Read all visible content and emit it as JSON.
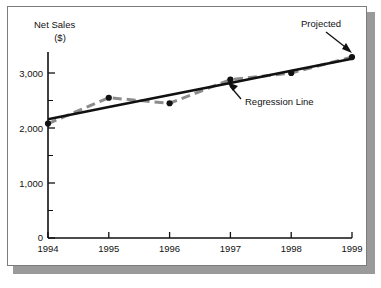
{
  "chart_data": {
    "type": "line",
    "title": "",
    "ylabel_line1": "Net Sales",
    "ylabel_line2": "($)",
    "xlabel": "",
    "categories": [
      "1994",
      "1995",
      "1996",
      "1997",
      "1998",
      "1999"
    ],
    "xlim": [
      1994,
      1999
    ],
    "ylim": [
      0,
      3400
    ],
    "grid": false,
    "legend_position": "none",
    "y_ticks_major": [
      0,
      1000,
      2000,
      3000
    ],
    "y_tick_labels": [
      "0",
      "1,000",
      "2,000",
      "3,000"
    ],
    "y_ticks_minor": [
      500,
      1500,
      2500,
      3500
    ],
    "series": [
      {
        "name": "Net Sales",
        "style": "dashed",
        "color": "#8c8c8c",
        "marker": "circle",
        "marker_color": "#111111",
        "values": [
          2080,
          2550,
          2450,
          2880,
          3000,
          3290
        ]
      },
      {
        "name": "Regression Line",
        "style": "solid",
        "color": "#111111",
        "marker": "none",
        "values": [
          2160,
          2380,
          2600,
          2820,
          3040,
          3260
        ]
      }
    ],
    "annotations": [
      {
        "label": "Projected",
        "target_year": "1999",
        "target_value": 3290,
        "arrow": "down-right"
      },
      {
        "label": "Regression Line",
        "target_year": "1997",
        "target_value": 2820,
        "arrow": "up-left"
      }
    ]
  },
  "colors": {
    "panel_border": "#7c7c7c",
    "panel_shadow": "#9a9a9a",
    "axis": "#111111",
    "actual_series": "#8c8c8c",
    "regression_series": "#111111",
    "marker": "#111111",
    "background": "#ffffff"
  }
}
